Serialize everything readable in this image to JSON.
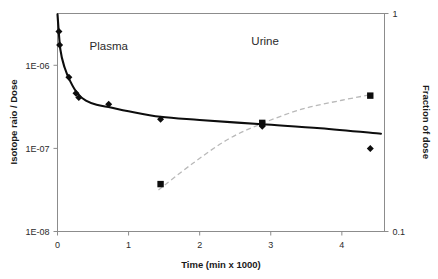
{
  "chart_data": {
    "type": "scatter",
    "title": "",
    "subtitle": "",
    "xlabel": "Time (min x 1000)",
    "ylabel": "Isotope raio / Dose",
    "y2label": "Fraction of dose",
    "xlim": [
      0,
      4.6
    ],
    "ylim": [
      1e-08,
      4.2e-06
    ],
    "y2lim": [
      0.1,
      1
    ],
    "yscale": "log",
    "y2scale": "log",
    "xscale": "linear",
    "grid": false,
    "legend_position": "inline-annotations",
    "xticks": [
      "0",
      "1",
      "2",
      "3",
      "4"
    ],
    "xtick_values": [
      0,
      1,
      2,
      3,
      4
    ],
    "yticks": [
      "1E-06",
      "1E-07",
      "1E-08"
    ],
    "ytick_values": [
      1e-06,
      1e-07,
      1e-08
    ],
    "y2ticks": [
      "1",
      "0.1"
    ],
    "y2tick_values": [
      1,
      0.1
    ],
    "annotations": [
      {
        "text": "Plasma",
        "x": 0.72,
        "y": 1.55e-06
      },
      {
        "text": "Urine",
        "x": 2.92,
        "y": 1.75e-06
      }
    ],
    "series": [
      {
        "name": "Plasma",
        "axis": "left",
        "marker": "diamond",
        "linestyle": "solid",
        "color": "#0d0d0d",
        "points": [
          {
            "x": 0.02,
            "y": 2.55e-06
          },
          {
            "x": 0.03,
            "y": 1.75e-06
          },
          {
            "x": 0.16,
            "y": 7.2e-07
          },
          {
            "x": 0.26,
            "y": 4.6e-07
          },
          {
            "x": 0.3,
            "y": 4.1e-07
          },
          {
            "x": 0.72,
            "y": 3.4e-07
          },
          {
            "x": 1.45,
            "y": 2.25e-07
          },
          {
            "x": 2.88,
            "y": 1.85e-07
          },
          {
            "x": 4.4,
            "y": 1e-07
          }
        ],
        "fit_curve": [
          {
            "x": 0.0,
            "y": 4.1e-06
          },
          {
            "x": 0.04,
            "y": 1.55e-06
          },
          {
            "x": 0.1,
            "y": 9.4e-07
          },
          {
            "x": 0.18,
            "y": 6.4e-07
          },
          {
            "x": 0.28,
            "y": 4.6e-07
          },
          {
            "x": 0.4,
            "y": 3.75e-07
          },
          {
            "x": 0.55,
            "y": 3.35e-07
          },
          {
            "x": 0.75,
            "y": 3.1e-07
          },
          {
            "x": 1.0,
            "y": 2.8e-07
          },
          {
            "x": 1.45,
            "y": 2.4e-07
          },
          {
            "x": 2.0,
            "y": 2.2e-07
          },
          {
            "x": 2.88,
            "y": 1.95e-07
          },
          {
            "x": 3.7,
            "y": 1.75e-07
          },
          {
            "x": 4.55,
            "y": 1.5e-07
          }
        ]
      },
      {
        "name": "Urine",
        "axis": "right",
        "marker": "square",
        "linestyle": "dashed",
        "color": "#b9b9b9",
        "points": [
          {
            "x": 1.45,
            "y": 0.165
          },
          {
            "x": 2.88,
            "y": 0.315
          },
          {
            "x": 4.4,
            "y": 0.42
          }
        ],
        "fit_curve": [
          {
            "x": 1.42,
            "y": 0.155
          },
          {
            "x": 1.9,
            "y": 0.205
          },
          {
            "x": 2.4,
            "y": 0.265
          },
          {
            "x": 2.9,
            "y": 0.315
          },
          {
            "x": 3.45,
            "y": 0.365
          },
          {
            "x": 4.0,
            "y": 0.4
          },
          {
            "x": 4.42,
            "y": 0.425
          }
        ]
      }
    ]
  }
}
